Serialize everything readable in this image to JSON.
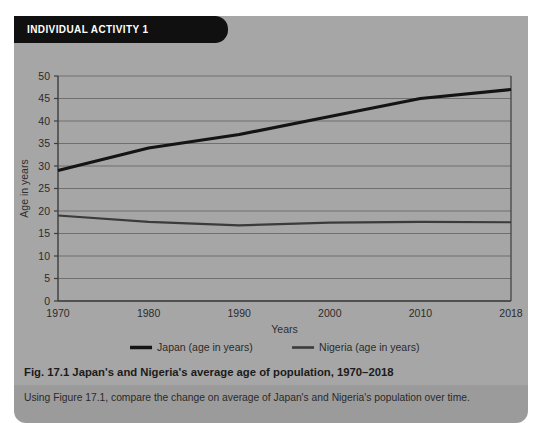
{
  "panel": {
    "header_label": "INDIVIDUAL ACTIVITY 1",
    "bg_color": "#a6a6a6",
    "header_color": "#101010",
    "task_strip_color": "#9b9b9b"
  },
  "figure": {
    "caption": "Fig. 17.1 Japan's and Nigeria's average age of population, 1970–2018"
  },
  "task": {
    "instruction": "Using Figure 17.1, compare the change on average of Japan's and Nigeria's population over time."
  },
  "chart_data": {
    "type": "line",
    "title": "",
    "xlabel": "Years",
    "ylabel": "Age in years",
    "x": [
      1970,
      1980,
      1990,
      2000,
      2010,
      2018
    ],
    "xtick_labels": [
      "1970",
      "1980",
      "1990",
      "2000",
      "2010",
      "2018"
    ],
    "ytick_labels": [
      "0",
      "5",
      "10",
      "15",
      "20",
      "25",
      "30",
      "35",
      "40",
      "45",
      "50"
    ],
    "yticks": [
      0,
      5,
      10,
      15,
      20,
      25,
      30,
      35,
      40,
      45,
      50
    ],
    "ylim": [
      0,
      50
    ],
    "grid": true,
    "legend_position": "bottom",
    "series": [
      {
        "name": "Japan (age in years)",
        "values": [
          29,
          34,
          37,
          41,
          45,
          47
        ],
        "color": "#141414",
        "width": 3.1
      },
      {
        "name": "Nigeria (age in years)",
        "values": [
          19,
          17.6,
          16.8,
          17.4,
          17.6,
          17.5
        ],
        "color": "#3b3b3b",
        "width": 2.2
      }
    ]
  },
  "axis": {
    "line_color": "#3d3d3d",
    "grid_color": "#6f6f6f"
  }
}
